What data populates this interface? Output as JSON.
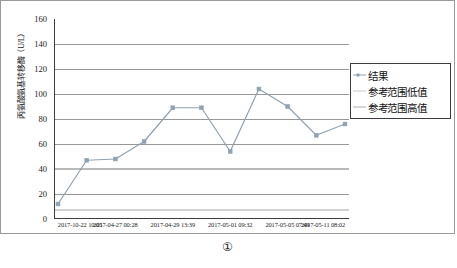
{
  "chart_data": {
    "type": "line",
    "title": "",
    "subtitle": "",
    "xlabel": "",
    "ylabel": "丙氨酸氨基转移酶（U/L）",
    "ylim": [
      0,
      160
    ],
    "ytick_step": 20,
    "yticks": [
      0,
      20,
      40,
      60,
      80,
      100,
      120,
      140,
      160
    ],
    "grid": true,
    "grid_axis": "y",
    "legend_position": "right",
    "categories": [
      "2017-10-22 10:05",
      "",
      "2017-04-27 00:28",
      "",
      "2017-04-29 13:39",
      "",
      "2017-05-01 09:32",
      "",
      "2017-05-05 07:49",
      "",
      "2017-05-11 08:02"
    ],
    "x_tick_labels": [
      "2017-10-22 10:05",
      "2017-04-27 00:28",
      "2017-04-29 13:39",
      "2017-05-01 09:32",
      "2017-05-05 07:49",
      "2017-05-11 08:02"
    ],
    "series": [
      {
        "name": "结果",
        "type": "line-marker",
        "color": "#8fa2b0",
        "values": [
          12,
          47,
          48,
          62,
          89,
          89,
          54,
          104,
          90,
          67,
          76
        ]
      },
      {
        "name": "参考范围低值",
        "type": "reference-line",
        "color": "#d2d2d2",
        "value": 7
      },
      {
        "name": "参考范围高值",
        "type": "reference-line",
        "color": "#b9b9b9",
        "value": 40
      }
    ]
  },
  "legend": {
    "items": [
      {
        "label": "结果",
        "color": "#8fa2b0",
        "marker": true
      },
      {
        "label": "参考范围低值",
        "color": "#c9c9c9",
        "marker": false
      },
      {
        "label": "参考范围高值",
        "color": "#b0b0b0",
        "marker": false
      }
    ]
  },
  "axis": {
    "y_title": "丙氨酸氨基转移酶（U/L）",
    "y_labels": [
      "160",
      "140",
      "120",
      "100",
      "80",
      "60",
      "40",
      "20",
      "0"
    ]
  },
  "caption": {
    "text": "①"
  },
  "colors": {
    "series_line": "#8fa2b0",
    "gridline": "#8c8c8c",
    "axis": "#3c3c3c",
    "frame": "#9a9a9a",
    "ref_low": "#d2d2d2",
    "ref_high": "#b9b9b9"
  }
}
